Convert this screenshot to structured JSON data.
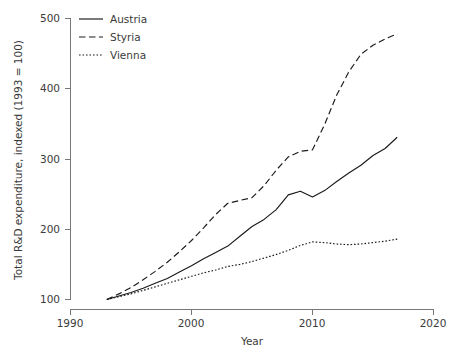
{
  "chart_data": {
    "type": "line",
    "title": "",
    "xlabel": "Year",
    "ylabel": "Total R&D expenditure, indexed (1993 = 100)",
    "xlim": [
      1990,
      2020
    ],
    "ylim": [
      100,
      500
    ],
    "xticks": [
      1990,
      2000,
      2010,
      2020
    ],
    "yticks": [
      100,
      200,
      300,
      400,
      500
    ],
    "grid": false,
    "legend_position": "top-left",
    "x": [
      1993,
      1994,
      1995,
      1996,
      1997,
      1998,
      1999,
      2000,
      2001,
      2002,
      2003,
      2004,
      2005,
      2006,
      2007,
      2008,
      2009,
      2010,
      2011,
      2012,
      2013,
      2014,
      2015,
      2016,
      2017
    ],
    "series": [
      {
        "name": "Austria",
        "style": "solid",
        "values": [
          100,
          105,
          110,
          116,
          123,
          130,
          139,
          148,
          158,
          167,
          176,
          190,
          204,
          214,
          228,
          249,
          254,
          246,
          255,
          268,
          280,
          291,
          305,
          315,
          331
        ]
      },
      {
        "name": "Styria",
        "style": "dashed",
        "values": [
          100,
          108,
          117,
          128,
          140,
          153,
          168,
          184,
          202,
          221,
          237,
          241,
          245,
          262,
          284,
          303,
          311,
          313,
          349,
          391,
          424,
          449,
          462,
          471,
          478
        ]
      },
      {
        "name": "Vienna",
        "style": "dotted",
        "values": [
          100,
          104,
          108,
          113,
          118,
          123,
          128,
          133,
          138,
          142,
          147,
          150,
          154,
          159,
          164,
          170,
          177,
          182,
          181,
          179,
          178,
          179,
          181,
          183,
          186
        ]
      }
    ]
  },
  "legend": {
    "items": [
      {
        "label": "Austria"
      },
      {
        "label": "Styria"
      },
      {
        "label": "Vienna"
      }
    ]
  },
  "axes": {
    "y_title": "Total R&D expenditure, indexed (1993 = 100)",
    "x_title": "Year",
    "y_tick_labels": [
      "500",
      "400",
      "300",
      "200",
      "100"
    ],
    "x_tick_labels": [
      "1990",
      "2000",
      "2010",
      "2020"
    ]
  },
  "colors": {
    "line": "#1a1a1a",
    "axis": "#777777",
    "text": "#3b3b3b",
    "background": "#ffffff"
  }
}
